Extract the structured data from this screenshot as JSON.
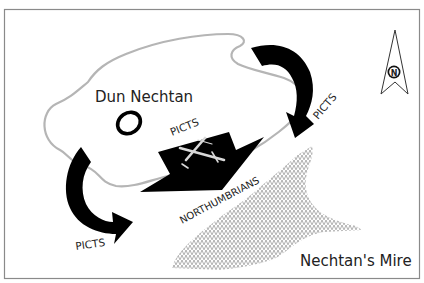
{
  "map": {
    "labels": {
      "fort": "Dun Nechtan",
      "mire": "Nechtan's Mire",
      "picts_top_right": "PICTS",
      "picts_center": "PICTS",
      "picts_bottom_left": "PICTS",
      "northumbrians": "NORTHUMBRIANS"
    },
    "compass": {
      "letter": "N"
    },
    "colors": {
      "frame": "#8a8a8a",
      "hill_outline": "#b5b5b5",
      "arrows": "#000000",
      "mire_pattern": "#8c8c8c",
      "text": "#222222"
    }
  }
}
